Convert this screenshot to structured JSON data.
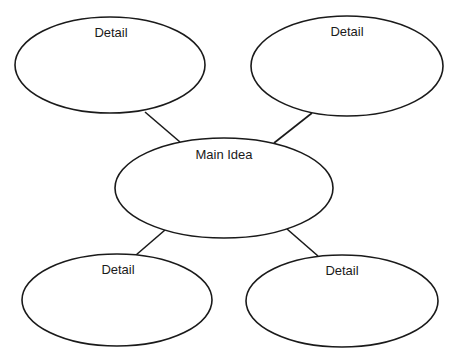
{
  "diagram": {
    "type": "web organizer",
    "stroke_color": "#1a1a1a",
    "background": "#ffffff",
    "main": {
      "label": "Main Idea"
    },
    "details": [
      {
        "label": "Detail",
        "position": "top-left"
      },
      {
        "label": "Detail",
        "position": "top-right"
      },
      {
        "label": "Detail",
        "position": "bottom-left"
      },
      {
        "label": "Detail",
        "position": "bottom-right"
      }
    ]
  }
}
